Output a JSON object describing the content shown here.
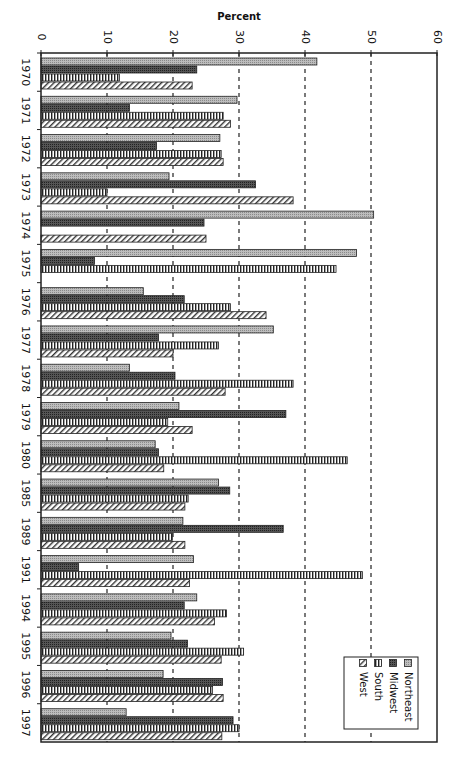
{
  "chart_data": {
    "type": "bar",
    "orientation": "horizontal (rendered rotated 90° — value axis across top, categories down the left)",
    "title": "",
    "xlabel": "Percent",
    "ylabel": "",
    "xlim": [
      0,
      60
    ],
    "x_ticks": [
      0,
      10,
      20,
      30,
      40,
      50,
      60
    ],
    "grid": "vertical dashed lines at 10-unit intervals",
    "legend_position": "bottom-right inside plot",
    "categories": [
      "1970",
      "1971",
      "1972",
      "1973",
      "1974",
      "1975",
      "1976",
      "1977",
      "1978",
      "1979",
      "1980",
      "1985",
      "1989",
      "1991",
      "1994",
      "1995",
      "1996",
      "1997"
    ],
    "series": [
      {
        "name": "Northeast",
        "pattern": "light-gray-dots",
        "values": [
          41.8,
          29.7,
          27.1,
          19.4,
          50.4,
          47.8,
          15.5,
          35.2,
          13.4,
          20.9,
          17.3,
          26.9,
          21.5,
          23.1,
          23.6,
          19.7,
          18.5,
          12.9
        ]
      },
      {
        "name": "Midwest",
        "pattern": "dark-gray-dots",
        "values": [
          23.6,
          13.4,
          17.5,
          32.5,
          24.7,
          8.1,
          21.7,
          17.8,
          20.3,
          37.1,
          17.8,
          28.6,
          36.7,
          5.7,
          21.7,
          22.2,
          27.5,
          29.1
        ]
      },
      {
        "name": "South",
        "pattern": "vertical-stripes",
        "values": [
          11.9,
          27.6,
          27.3,
          10.0,
          0,
          44.7,
          28.7,
          26.9,
          38.2,
          19.2,
          46.4,
          22.3,
          19.9,
          48.7,
          28.1,
          30.7,
          26.0,
          30.0
        ]
      },
      {
        "name": "West",
        "pattern": "diagonal-hatch",
        "values": [
          22.9,
          28.7,
          27.6,
          38.2,
          25.0,
          0,
          34.1,
          20.0,
          27.9,
          22.9,
          18.6,
          21.8,
          21.8,
          22.5,
          26.3,
          27.3,
          27.6,
          27.4
        ]
      }
    ]
  },
  "axis": {
    "title": "Percent",
    "ticks": [
      "0",
      "10",
      "20",
      "30",
      "40",
      "50",
      "60"
    ]
  },
  "legend": {
    "items": [
      "Northeast",
      "Midwest",
      "South",
      "West"
    ]
  }
}
